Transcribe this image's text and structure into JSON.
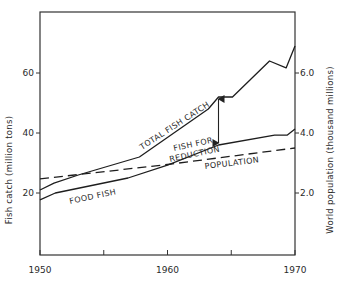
{
  "chart_data": {
    "type": "line",
    "title": "",
    "xlabel": "",
    "ylabel": "Fish catch (million tons)",
    "y2label": "World population (thousand millions)",
    "xlim": [
      1950,
      1970
    ],
    "ylim": [
      0,
      80
    ],
    "y2lim": [
      0,
      8.0
    ],
    "grid": false,
    "legend": "inline labels",
    "x_ticks": [
      1950,
      1955,
      1960,
      1965,
      1970
    ],
    "x_tick_labels": [
      "1950",
      "",
      "1960",
      "",
      "1970"
    ],
    "y_ticks": [
      20,
      40,
      60
    ],
    "y_tick_labels": [
      "20",
      "40",
      "60"
    ],
    "y2_ticks": [
      2.0,
      4.0,
      6.0
    ],
    "y2_tick_labels": [
      "2.0",
      "4.0",
      "6.0"
    ],
    "series": [
      {
        "name": "TOTAL FISH CATCH",
        "axis": "left",
        "style": "solid",
        "points": [
          [
            1950,
            21
          ],
          [
            1951.1,
            23.3
          ],
          [
            1953,
            26
          ],
          [
            1957.8,
            32
          ],
          [
            1963.2,
            48
          ],
          [
            1964,
            52
          ],
          [
            1965.1,
            52
          ],
          [
            1968,
            64
          ],
          [
            1969.3,
            61.7
          ],
          [
            1970,
            69
          ]
        ]
      },
      {
        "name": "FOOD FISH",
        "axis": "left",
        "style": "solid",
        "points": [
          [
            1950,
            17.7
          ],
          [
            1951.2,
            20
          ],
          [
            1956.9,
            25
          ],
          [
            1960,
            29.3
          ],
          [
            1964,
            36
          ],
          [
            1968.4,
            39.3
          ],
          [
            1969.4,
            39.3
          ],
          [
            1970,
            41.3
          ]
        ]
      },
      {
        "name": "POPULATION",
        "axis": "right",
        "style": "dashed",
        "points": [
          [
            1950,
            2.47
          ],
          [
            1960,
            2.95
          ],
          [
            1970,
            3.5
          ]
        ]
      }
    ],
    "annotations": [
      {
        "text": "FISH FOR REDUCTION",
        "type": "double-arrow",
        "x": 1964,
        "y_from": 52,
        "y_to": 36
      }
    ]
  },
  "labels": {
    "y_axis_left": "Fish catch (million tons)",
    "y_axis_right": "World population (thousand millions)",
    "total": "TOTAL FISH CATCH",
    "food": "FOOD FISH",
    "reduction_line1": "FISH FOR",
    "reduction_line2": "REDUCTION",
    "population": "POPULATION"
  }
}
